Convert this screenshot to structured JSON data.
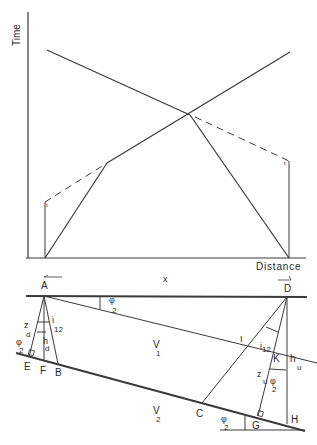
{
  "time_distance_plot": {
    "y_axis_label": "Time",
    "x_axis_label": "Distance",
    "lines": [
      {
        "name": "downdip-direct-and-refracted",
        "style": "solid"
      },
      {
        "name": "updip-reverse-refracted",
        "style": "solid"
      },
      {
        "name": "downdip-intercept-extension",
        "style": "dashed"
      },
      {
        "name": "updip-intercept-extension",
        "style": "dashed"
      }
    ],
    "intercept_tick_symbol": "t"
  },
  "geometry": {
    "x_label": "x",
    "shot_points": {
      "left": "A",
      "right": "D"
    },
    "points": {
      "E": "E",
      "F": "F",
      "B": "B",
      "C": "C",
      "G": "G",
      "H": "H",
      "I": "I",
      "K": "K"
    },
    "angles": {
      "dip": {
        "symbol": "φ",
        "sub": "2"
      },
      "critical": {
        "symbol": "i",
        "sub": "12"
      }
    },
    "depths": {
      "zd": {
        "symbol": "z",
        "sub": "d"
      },
      "hd": {
        "symbol": "h",
        "sub": "d"
      },
      "zu": {
        "symbol": "z",
        "sub": "u"
      },
      "hu": {
        "symbol": "h",
        "sub": "u"
      }
    },
    "velocities": {
      "v1": {
        "symbol": "V",
        "sub": "1"
      },
      "v2": {
        "symbol": "V",
        "sub": "2"
      }
    }
  }
}
